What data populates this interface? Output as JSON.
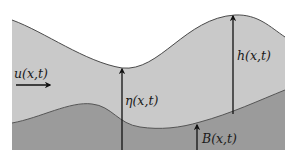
{
  "diagram": {
    "type": "shallow-water-cross-section",
    "colors": {
      "background": "#ffffff",
      "water": "#c9c9c9",
      "bed": "#9b9b9b",
      "surface_line": "#4a4a4a",
      "bed_line": "#555555",
      "arrow": "#111111"
    },
    "labels": {
      "velocity": "u(x,t)",
      "surface_elevation": "η(x,t)",
      "depth": "h(x,t)",
      "bottom": "B(x,t)"
    },
    "arrows": [
      {
        "name": "velocity-arrow",
        "direction": "right",
        "label": "u(x,t)"
      },
      {
        "name": "eta-arrow",
        "direction": "up",
        "label": "η(x,t)",
        "from": "reference-bottom",
        "to": "free-surface"
      },
      {
        "name": "h-arrow",
        "direction": "up",
        "label": "h(x,t)",
        "from": "bed",
        "to": "free-surface"
      },
      {
        "name": "b-arrow",
        "direction": "up",
        "label": "B(x,t)",
        "from": "reference-bottom",
        "to": "bed"
      }
    ],
    "regions": [
      {
        "name": "water-layer",
        "description": "fluid between bed and free surface"
      },
      {
        "name": "bed-layer",
        "description": "bottom topography"
      }
    ]
  }
}
